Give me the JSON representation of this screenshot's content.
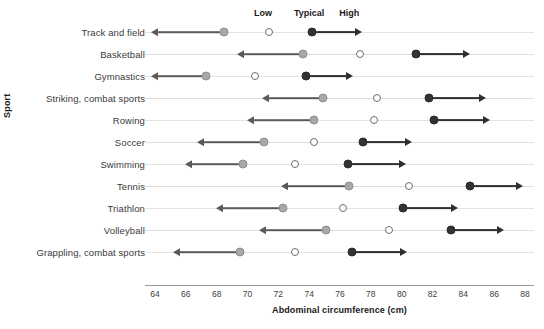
{
  "chart_data": {
    "type": "scatter",
    "title": "",
    "xlabel": "Abdominal circumference (cm)",
    "ylabel": "Sport",
    "xlim": [
      64,
      88
    ],
    "xticks": [
      64,
      66,
      68,
      70,
      72,
      74,
      76,
      78,
      80,
      82,
      84,
      86,
      88
    ],
    "grid": "horizontal-row-lines",
    "legend_position": "top",
    "legend": [
      {
        "key": "low",
        "label": "Low",
        "x_value": 71.0
      },
      {
        "key": "typical",
        "label": "Typical",
        "x_value": 74.0
      },
      {
        "key": "high",
        "label": "High",
        "x_value": 76.6
      }
    ],
    "series": [
      {
        "name": "Low",
        "marker": "filled-gray-circle",
        "color": "#a8a8a8",
        "values": [
          68.5,
          73.6,
          67.3,
          74.9,
          74.3,
          71.1,
          69.7,
          76.6,
          72.3,
          75.1,
          69.5
        ]
      },
      {
        "name": "Typical",
        "marker": "open-circle",
        "color": "#ffffff",
        "values": [
          71.4,
          77.3,
          70.5,
          78.4,
          78.2,
          74.3,
          73.1,
          80.5,
          76.2,
          79.2,
          73.1
        ]
      },
      {
        "name": "High",
        "marker": "filled-black-circle",
        "color": "#333333",
        "values": [
          74.2,
          80.9,
          73.8,
          81.8,
          82.1,
          77.5,
          76.5,
          84.4,
          80.1,
          83.2,
          76.8
        ]
      }
    ],
    "categories": [
      "Track and field",
      "Basketball",
      "Gymnastics",
      "Striking, combat sports",
      "Rowing",
      "Soccer",
      "Swimming",
      "Tennis",
      "Triathlon",
      "Volleyball",
      "Grappling, combat sports"
    ],
    "rows": [
      {
        "sport": "Track and field",
        "low": 68.5,
        "typical": 71.4,
        "high": 74.2,
        "low_arrow_to": 64.2,
        "high_arrow_to": 77.0
      },
      {
        "sport": "Basketball",
        "low": 73.6,
        "typical": 77.3,
        "high": 80.9,
        "low_arrow_to": 69.8,
        "high_arrow_to": 84.0
      },
      {
        "sport": "Gymnastics",
        "low": 67.3,
        "typical": 70.5,
        "high": 73.8,
        "low_arrow_to": 64.2,
        "high_arrow_to": 76.4
      },
      {
        "sport": "Striking, combat sports",
        "low": 74.9,
        "typical": 78.4,
        "high": 81.8,
        "low_arrow_to": 71.4,
        "high_arrow_to": 85.0
      },
      {
        "sport": "Rowing",
        "low": 74.3,
        "typical": 78.2,
        "high": 82.1,
        "low_arrow_to": 70.4,
        "high_arrow_to": 85.3
      },
      {
        "sport": "Soccer",
        "low": 71.1,
        "typical": 74.3,
        "high": 77.5,
        "low_arrow_to": 67.2,
        "high_arrow_to": 80.2
      },
      {
        "sport": "Swimming",
        "low": 69.7,
        "typical": 73.1,
        "high": 76.5,
        "low_arrow_to": 66.4,
        "high_arrow_to": 79.8
      },
      {
        "sport": "Tennis",
        "low": 76.6,
        "typical": 80.5,
        "high": 84.4,
        "low_arrow_to": 72.6,
        "high_arrow_to": 87.4
      },
      {
        "sport": "Triathlon",
        "low": 72.3,
        "typical": 76.2,
        "high": 80.1,
        "low_arrow_to": 68.4,
        "high_arrow_to": 83.2
      },
      {
        "sport": "Volleyball",
        "low": 75.1,
        "typical": 79.2,
        "high": 83.2,
        "low_arrow_to": 71.2,
        "high_arrow_to": 86.2
      },
      {
        "sport": "Grappling, combat sports",
        "low": 69.5,
        "typical": 73.1,
        "high": 76.8,
        "low_arrow_to": 65.6,
        "high_arrow_to": 79.9
      }
    ]
  }
}
